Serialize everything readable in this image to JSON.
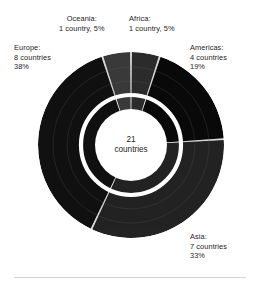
{
  "figure": {
    "center_label_line1": "21",
    "center_label_line2": "countries",
    "background_color": "#ffffff",
    "text_color": "#1c1c1c",
    "divider_color": "#d3d3d3"
  },
  "labels": {
    "oceania": {
      "title": "Oceania:",
      "line2": "1 country, 5%"
    },
    "africa": {
      "title": "Africa:",
      "line2": "1 country, 5%"
    },
    "europe": {
      "title": "Europe:",
      "line2": "8 countries",
      "line3": "38%"
    },
    "americas": {
      "title": "Americas:",
      "line2": "4 countries",
      "line3": "19%"
    },
    "asia": {
      "title": "Asia:",
      "line2": "7 countries",
      "line3": "33%"
    }
  },
  "chart_data": {
    "type": "pie",
    "title": "",
    "subtitle": "",
    "xlabel": "",
    "ylabel": "",
    "legend_position": "callout-labels",
    "grid": false,
    "hole_ratio": 0.38,
    "center_annotation": "21 countries",
    "total": 21,
    "total_unit": "countries",
    "start_angle_deg": 0,
    "direction": "clockwise",
    "categories": [
      "Africa",
      "Americas",
      "Asia",
      "Europe",
      "Oceania"
    ],
    "values": [
      1,
      4,
      7,
      8,
      1
    ],
    "percentages": [
      5,
      19,
      33,
      38,
      5
    ],
    "colors": [
      "#2c2c2c",
      "#0a0a0a",
      "#232323",
      "#111111",
      "#3a3a3a"
    ],
    "slices": [
      {
        "name": "Africa",
        "countries": 1,
        "percent": 5,
        "color": "#2c2c2c",
        "label": "Africa: 1 country, 5%"
      },
      {
        "name": "Americas",
        "countries": 4,
        "percent": 19,
        "color": "#0a0a0a",
        "label": "Americas: 4 countries 19%"
      },
      {
        "name": "Asia",
        "countries": 7,
        "percent": 33,
        "color": "#232323",
        "label": "Asia: 7 countries 33%"
      },
      {
        "name": "Europe",
        "countries": 8,
        "percent": 38,
        "color": "#111111",
        "label": "Europe: 8 countries 38%"
      },
      {
        "name": "Oceania",
        "countries": 1,
        "percent": 5,
        "color": "#3a3a3a",
        "label": "Oceania: 1 country, 5%"
      }
    ]
  }
}
